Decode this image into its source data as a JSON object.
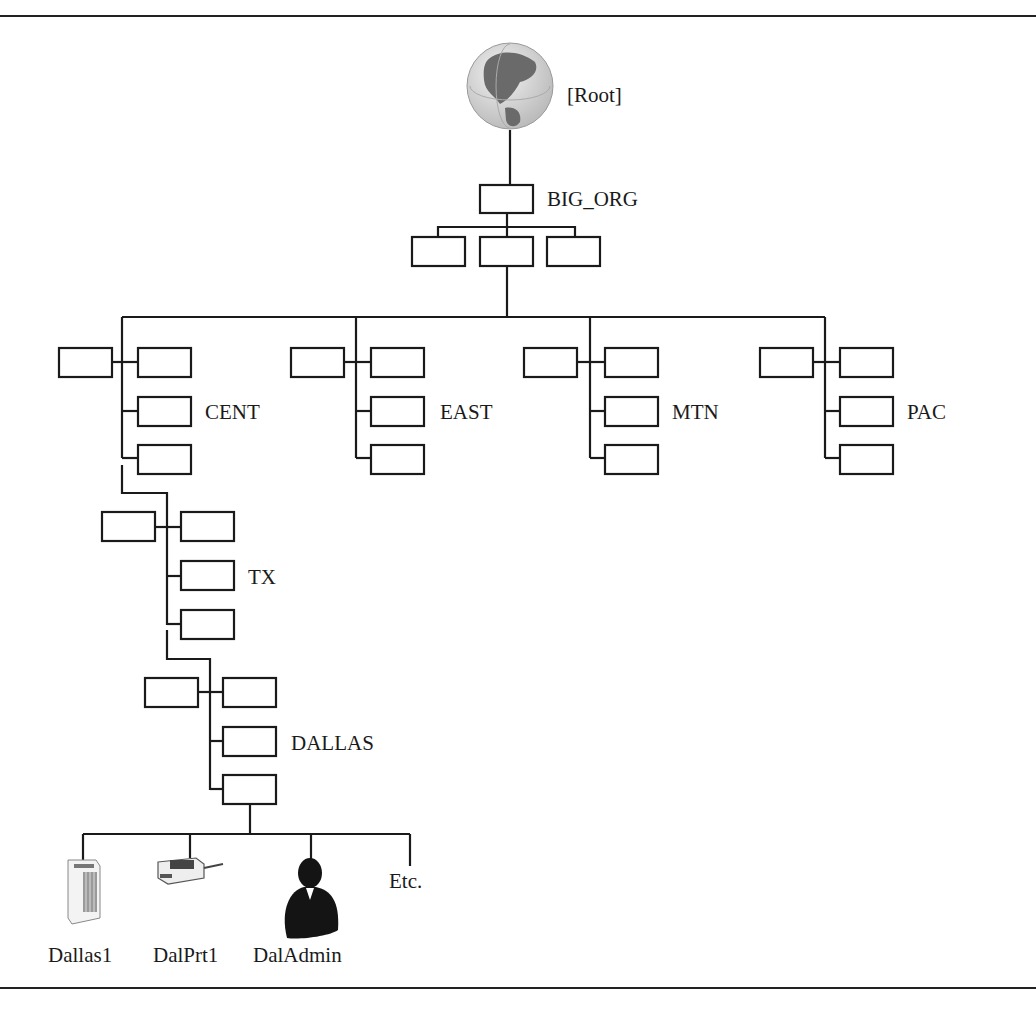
{
  "diagram": {
    "type": "tree",
    "root": {
      "label": "[Root]",
      "icon": "globe-icon"
    },
    "organization": {
      "label": "BIG_ORG"
    },
    "regions": [
      {
        "label": "CENT"
      },
      {
        "label": "EAST"
      },
      {
        "label": "MTN"
      },
      {
        "label": "PAC"
      }
    ],
    "state": {
      "label": "TX"
    },
    "city": {
      "label": "DALLAS"
    },
    "leaves": [
      {
        "label": "Dallas1",
        "icon": "server-icon"
      },
      {
        "label": "DalPrt1",
        "icon": "printer-icon"
      },
      {
        "label": "DalAdmin",
        "icon": "user-silhouette-icon"
      },
      {
        "label": "Etc."
      }
    ]
  }
}
